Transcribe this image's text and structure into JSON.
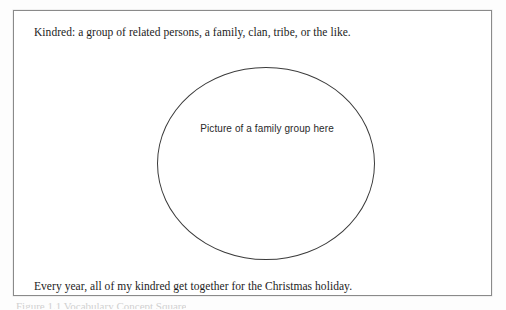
{
  "page": {
    "background_color": "#fdfdfd",
    "text_color": "#1c1c1c"
  },
  "worksheet": {
    "border_color": "#8a8a8a",
    "definition": "Kindred:  a group of related persons, a family, clan, tribe, or the like.",
    "placeholder": {
      "shape": "ellipse",
      "outline_color": "#3b3b3b",
      "caption": "Picture of a family group here"
    },
    "example_sentence": "Every year, all of my kindred get together for the Christmas holiday."
  },
  "footer": {
    "clipped_caption": "Figure 1.1 Vocabulary Concept Square"
  }
}
